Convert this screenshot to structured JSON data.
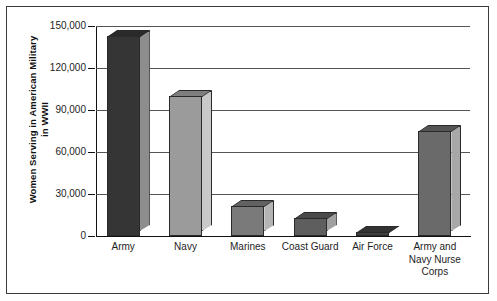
{
  "chart_data": {
    "type": "bar",
    "title": "",
    "xlabel": "",
    "ylabel": "Women Serving in American Military\nin WWII",
    "categories": [
      "Army",
      "Navy",
      "Marines",
      "Coast Guard",
      "Air Force",
      "Army and\nNavy Nurse\nCorps"
    ],
    "values": [
      143000,
      100000,
      21500,
      13000,
      3000,
      75000
    ],
    "ylim": [
      0,
      150000
    ],
    "yticks": [
      0,
      30000,
      60000,
      90000,
      120000,
      150000
    ],
    "ytick_labels": [
      "0",
      "30,000",
      "60,000",
      "90,000",
      "120,000",
      "150,000"
    ],
    "grid": true,
    "legend": "none",
    "style": "3d-bar",
    "bar_colors": [
      "#353535",
      "#9b9b9b",
      "#7a7a7a",
      "#5e5e5e",
      "#3f3f3f",
      "#6a6a6a"
    ],
    "bar_top_colors": [
      "#2a2a2a",
      "#7e7e7e",
      "#616161",
      "#4a4a4a",
      "#333333",
      "#545454"
    ],
    "bar_side_colors": [
      "#8d8d8d",
      "#c9c9c9",
      "#b4b4b4",
      "#a0a0a0",
      "#8a8a8a",
      "#a8a8a8"
    ],
    "axis_color": "#111111",
    "grid_color": "#555555"
  }
}
